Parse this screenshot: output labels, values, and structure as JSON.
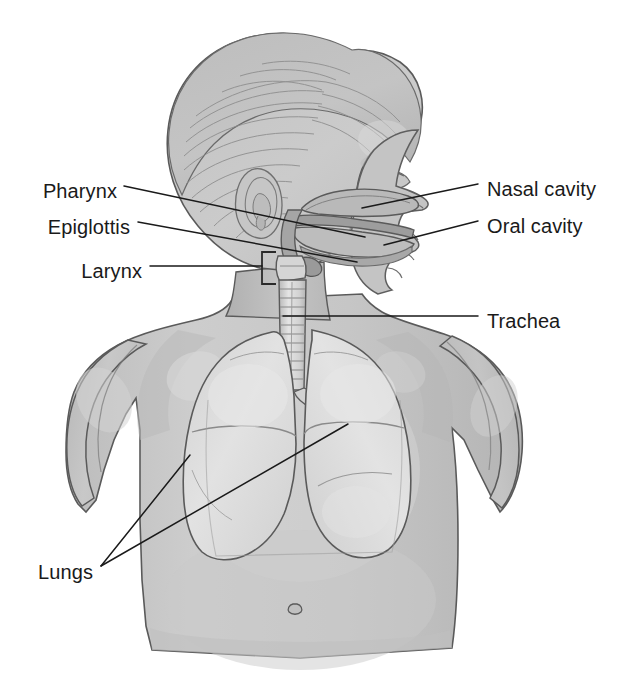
{
  "figure": {
    "background_color": "#ffffff",
    "line_color": "#3a3a3a",
    "skin_fill": "#c9c9c9",
    "skin_shadow": "#b4b4b4",
    "skin_highlight": "#d6d6d6",
    "hair_fill": "#bdbdbd",
    "lung_fill": "#dedede",
    "lung_shadow": "#cacaca",
    "airway_fill": "#a9a9a9",
    "trachea_fill": "#d8d8d8",
    "outline_color": "#555555"
  },
  "labels": {
    "left": [
      {
        "id": "pharynx",
        "text": "Pharynx",
        "x": 117,
        "y": 192
      },
      {
        "id": "epiglottis",
        "text": "Epiglottis",
        "x": 130,
        "y": 228
      },
      {
        "id": "larynx",
        "text": "Larynx",
        "x": 142,
        "y": 272
      },
      {
        "id": "lungs",
        "text": "Lungs",
        "x": 93,
        "y": 573
      }
    ],
    "right": [
      {
        "id": "nasal-cavity",
        "text": "Nasal cavity",
        "x": 487,
        "y": 190
      },
      {
        "id": "oral-cavity",
        "text": "Oral cavity",
        "x": 487,
        "y": 227
      },
      {
        "id": "trachea",
        "text": "Trachea",
        "x": 487,
        "y": 322
      }
    ]
  },
  "leader_lines": [
    {
      "id": "pharynx-leader",
      "from": [
        124,
        186
      ],
      "to": [
        365,
        237
      ]
    },
    {
      "id": "epiglottis-leader",
      "from": [
        138,
        222
      ],
      "to": [
        357,
        262
      ]
    },
    {
      "id": "larynx-leader",
      "from": [
        150,
        266
      ],
      "to": [
        262,
        266
      ]
    },
    {
      "id": "nasal-cavity-leader",
      "from": [
        478,
        184
      ],
      "to": [
        362,
        208
      ]
    },
    {
      "id": "oral-cavity-leader",
      "from": [
        478,
        221
      ],
      "to": [
        384,
        245
      ]
    },
    {
      "id": "trachea-leader",
      "from": [
        478,
        316
      ],
      "to": [
        283,
        316
      ]
    },
    {
      "id": "lungs-leader-left",
      "from": [
        101,
        566
      ],
      "to": [
        190,
        455
      ]
    },
    {
      "id": "lungs-leader-right",
      "from": [
        101,
        566
      ],
      "to": [
        348,
        424
      ]
    }
  ],
  "markers": {
    "larynx_bracket": {
      "x": 262,
      "y": 252,
      "width": 14,
      "height": 32
    }
  },
  "structures": [
    {
      "id": "head",
      "name": "head"
    },
    {
      "id": "hair",
      "name": "hair"
    },
    {
      "id": "ear",
      "name": "ear"
    },
    {
      "id": "eye",
      "name": "eye"
    },
    {
      "id": "nose",
      "name": "nose"
    },
    {
      "id": "nasal-cavity",
      "name": "nasal cavity"
    },
    {
      "id": "oral-cavity",
      "name": "oral cavity"
    },
    {
      "id": "tongue",
      "name": "tongue"
    },
    {
      "id": "pharynx",
      "name": "pharynx"
    },
    {
      "id": "epiglottis",
      "name": "epiglottis"
    },
    {
      "id": "larynx",
      "name": "larynx"
    },
    {
      "id": "trachea",
      "name": "trachea"
    },
    {
      "id": "bronchi",
      "name": "bronchi"
    },
    {
      "id": "left-lung",
      "name": "left lung"
    },
    {
      "id": "right-lung",
      "name": "right lung"
    },
    {
      "id": "torso",
      "name": "torso"
    },
    {
      "id": "left-arm",
      "name": "left arm"
    },
    {
      "id": "right-arm",
      "name": "right arm"
    },
    {
      "id": "navel",
      "name": "navel"
    }
  ]
}
